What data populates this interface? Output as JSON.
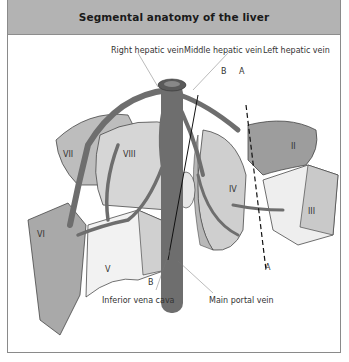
{
  "title": "Segmental anatomy of the liver",
  "labels": {
    "right_hepatic_vein": "Right hepatic vein",
    "middle_hepatic_vein": "Middle hepatic vein",
    "left_hepatic_vein": "Left hepatic vein",
    "inferior_vena_cava": "Inferior vena cava",
    "main_portal_vein": "Main portal vein",
    "plane_a_top": "A",
    "plane_a_bottom": "A",
    "plane_b_top": "B",
    "plane_b_bottom": "B"
  },
  "segments": [
    "II",
    "III",
    "IV",
    "V",
    "VI",
    "VII",
    "VIII"
  ],
  "colors": {
    "header_bg": "#b3b3b3",
    "vessel": "#6e6e6e",
    "segment_light": "#dcdcdc",
    "segment_mid": "#bdbdbd",
    "segment_dark": "#8e8e8e",
    "frame": "#8a8a8a"
  }
}
